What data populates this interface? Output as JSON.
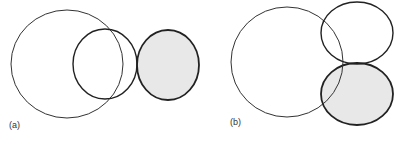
{
  "panels": [
    {
      "label": "(a)",
      "circles": [
        {
          "cx": 67,
          "cy": 64,
          "rx": 56,
          "ry": 54,
          "fill": "none",
          "stroke": "#333333",
          "width": 1
        },
        {
          "cx": 105,
          "cy": 64,
          "rx": 32,
          "ry": 35,
          "fill": "none",
          "stroke": "#222222",
          "width": 1.4
        },
        {
          "cx": 168,
          "cy": 65,
          "rx": 31,
          "ry": 35,
          "fill": "#e8e8e8",
          "stroke": "#222222",
          "width": 1.8
        }
      ]
    },
    {
      "label": "(b)",
      "circles": [
        {
          "cx": 287,
          "cy": 62,
          "rx": 56,
          "ry": 55,
          "fill": "none",
          "stroke": "#333333",
          "width": 1
        },
        {
          "cx": 357,
          "cy": 33,
          "rx": 36,
          "ry": 31,
          "fill": "none",
          "stroke": "#222222",
          "width": 1.4
        },
        {
          "cx": 357,
          "cy": 94,
          "rx": 36,
          "ry": 31,
          "fill": "#e8e8e8",
          "stroke": "#222222",
          "width": 1.8
        }
      ]
    }
  ],
  "colors": {
    "shade": "#e8e8e8",
    "stroke": "#222222"
  }
}
